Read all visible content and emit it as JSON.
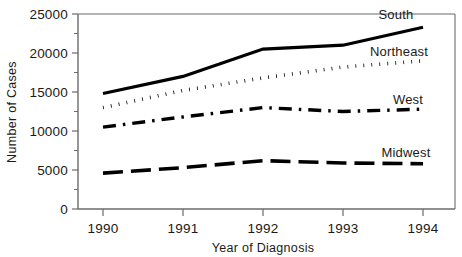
{
  "chart_data": {
    "type": "line",
    "title": "",
    "xlabel": "Year of Diagnosis",
    "ylabel": "Number of Cases",
    "x": [
      1990,
      1991,
      1992,
      1993,
      1994
    ],
    "xtick_labels": [
      "1990",
      "1991",
      "1992",
      "1993",
      "1994"
    ],
    "ytick_labels": [
      "0",
      "5000",
      "10000",
      "15000",
      "20000",
      "25000"
    ],
    "ytick_values": [
      0,
      5000,
      10000,
      15000,
      20000,
      25000
    ],
    "yminor_values": [
      2500,
      7500,
      12500,
      17500,
      22500
    ],
    "xlim": [
      1989.5,
      1994.4
    ],
    "ylim": [
      0,
      25000
    ],
    "grid": false,
    "legend_position": "inline-right-of-series",
    "series": [
      {
        "name": "South",
        "style": "solid",
        "color": "#000000",
        "values": [
          14800,
          17000,
          20500,
          21000,
          23300
        ]
      },
      {
        "name": "Northeast",
        "style": "dotted",
        "color": "#000000",
        "values": [
          13000,
          15200,
          16800,
          18200,
          19000
        ]
      },
      {
        "name": "West",
        "style": "dash-dot",
        "color": "#000000",
        "values": [
          10500,
          11800,
          13000,
          12500,
          12800
        ]
      },
      {
        "name": "Midwest",
        "style": "dashed",
        "color": "#000000",
        "values": [
          4600,
          5300,
          6200,
          5900,
          5800
        ]
      }
    ]
  },
  "axes": {
    "y_label": "Number of Cases",
    "x_label": "Year of Diagnosis",
    "y_ticks": [
      {
        "label": "25000"
      },
      {
        "label": "20000"
      },
      {
        "label": "15000"
      },
      {
        "label": "10000"
      },
      {
        "label": "5000"
      },
      {
        "label": "0"
      }
    ],
    "x_ticks": [
      {
        "label": "1990"
      },
      {
        "label": "1991"
      },
      {
        "label": "1992"
      },
      {
        "label": "1993"
      },
      {
        "label": "1994"
      }
    ]
  },
  "series_labels": {
    "south": "South",
    "northeast": "Northeast",
    "west": "West",
    "midwest": "Midwest"
  },
  "colors": {
    "ink": "#000000",
    "axis": "#6b6b6b",
    "background": "#ffffff"
  }
}
